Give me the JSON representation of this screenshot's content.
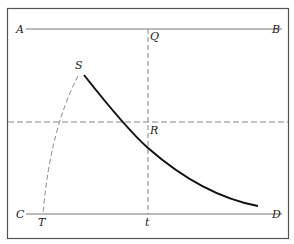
{
  "diagram": {
    "colors": {
      "frame": "#555555",
      "solid_line": "#777777",
      "dashed_line": "#888888",
      "curve": "#111111",
      "label": "#222222"
    },
    "labels": {
      "A": "A",
      "B": "B",
      "C": "C",
      "D": "D",
      "Q": "Q",
      "R": "R",
      "S": "S",
      "T": "T",
      "t": "t"
    },
    "lines": {
      "AB": {
        "from": "A",
        "to": "B",
        "style": "solid"
      },
      "CD": {
        "from": "C",
        "to": "D",
        "style": "solid"
      },
      "Qt": {
        "from": "Q",
        "to": "t",
        "style": "dashed",
        "orientation": "vertical"
      },
      "horizontal_mid": {
        "style": "dashed",
        "orientation": "horizontal"
      },
      "ST": {
        "from": "S",
        "to": "T",
        "style": "dashed",
        "shape": "curve"
      },
      "main_curve": {
        "from": "S",
        "through": "R",
        "style": "solid-bold",
        "shape": "decreasing curve"
      }
    }
  }
}
